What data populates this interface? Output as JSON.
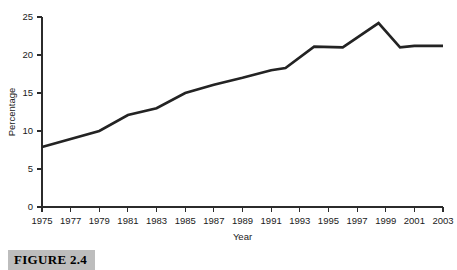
{
  "figure": {
    "caption": "FIGURE 2.4"
  },
  "chart_data": {
    "type": "line",
    "title": "",
    "xlabel": "Year",
    "ylabel": "Percentage",
    "xlim": [
      1975,
      2003
    ],
    "ylim": [
      0,
      25
    ],
    "grid": false,
    "legend": "none",
    "x_tick_labels": [
      "1975",
      "1977",
      "1979",
      "1981",
      "1983",
      "1985",
      "1987",
      "1989",
      "1991",
      "1993",
      "1995",
      "1997",
      "1999",
      "2001",
      "2003"
    ],
    "x_tick_values": [
      1975,
      1977,
      1979,
      1981,
      1983,
      1985,
      1987,
      1989,
      1991,
      1993,
      1995,
      1997,
      1999,
      2001,
      2003
    ],
    "y_tick_labels": [
      "0",
      "5",
      "10",
      "15",
      "20",
      "25"
    ],
    "y_tick_values": [
      0,
      5,
      10,
      15,
      20,
      25
    ],
    "line_color": "#232323",
    "x": [
      1975,
      1979,
      1981,
      1983,
      1985,
      1987,
      1989,
      1991,
      1992,
      1994,
      1996,
      1998.5,
      2000,
      2001,
      2003
    ],
    "values": [
      7.9,
      10.0,
      12.1,
      13.0,
      15.0,
      16.1,
      17.0,
      18.0,
      18.3,
      21.1,
      21.0,
      24.2,
      21.0,
      21.2,
      21.2
    ],
    "series": [
      {
        "name": "Percentage",
        "values": [
          7.9,
          10.0,
          12.1,
          13.0,
          15.0,
          16.1,
          17.0,
          18.0,
          18.3,
          21.1,
          21.0,
          24.2,
          21.0,
          21.2,
          21.2
        ]
      }
    ]
  }
}
